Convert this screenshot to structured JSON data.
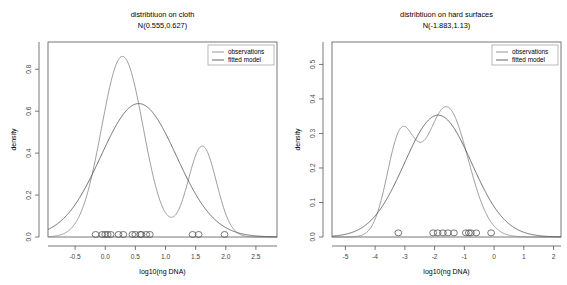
{
  "figure": {
    "width": 567,
    "height": 285,
    "background": "#ffffff",
    "line_color_observations": "#8a8a8a",
    "line_color_fitted": "#555555",
    "axis_color": "#555555"
  },
  "chart_data": [
    {
      "type": "line",
      "panel": "left",
      "title": "distribtiuon on cloth",
      "subtitle": "N(0.555,0.627)",
      "xlabel": "log10(ng DNA)",
      "ylabel": "density",
      "xlim": [
        -0.95,
        2.85
      ],
      "ylim": [
        0.0,
        0.93
      ],
      "xticks": [
        -0.5,
        0.0,
        0.5,
        1.0,
        1.5,
        2.0,
        2.5
      ],
      "xticklabels": [
        "-0.5",
        "0.0",
        "0.5",
        "1.0",
        "1.5",
        "2.0",
        "2.5"
      ],
      "yticks": [
        0.0,
        0.2,
        0.4,
        0.6,
        0.8
      ],
      "yticklabels": [
        "0.0",
        "0.2",
        "0.4",
        "0.6",
        "0.8"
      ],
      "grid": false,
      "legend_position": "top-right",
      "series": [
        {
          "name": "observations",
          "kind": "kernel-density-bimodal",
          "color": "#8a8a8a",
          "components": [
            {
              "weight": 0.745,
              "mean": 0.285,
              "sd": 0.345
            },
            {
              "weight": 0.255,
              "mean": 1.61,
              "sd": 0.235
            }
          ],
          "peaks": [
            {
              "x": 0.285,
              "y": 0.855
            },
            {
              "x": 1.61,
              "y": 0.265
            }
          ],
          "trough": {
            "x": 1.1,
            "y": 0.07
          }
        },
        {
          "name": "fitted model",
          "kind": "normal",
          "color": "#555555",
          "mean": 0.555,
          "sd": 0.627,
          "peak": {
            "x": 0.555,
            "y": 0.636
          }
        }
      ],
      "rug": {
        "name": "observations-rug",
        "marker": "open-circle",
        "y": 0.012,
        "values": [
          -0.16,
          -0.05,
          0.0,
          0.04,
          0.09,
          0.22,
          0.3,
          0.45,
          0.5,
          0.58,
          0.6,
          0.68,
          0.74,
          1.45,
          1.55,
          1.98
        ]
      }
    },
    {
      "type": "line",
      "panel": "right",
      "title": "distribtiuon on hard surfaces",
      "subtitle": "N(-1.883,1.13)",
      "xlabel": "log10(ng DNA)",
      "ylabel": "density",
      "xlim": [
        -5.45,
        2.25
      ],
      "ylim": [
        0.0,
        0.565
      ],
      "xticks": [
        -5,
        -4,
        -3,
        -2,
        -1,
        0,
        1,
        2
      ],
      "xticklabels": [
        "-5",
        "-4",
        "-3",
        "-2",
        "-1",
        "0",
        "1",
        "2"
      ],
      "yticks": [
        0.0,
        0.1,
        0.2,
        0.3,
        0.4,
        0.5
      ],
      "yticklabels": [
        "0.0",
        "0.1",
        "0.2",
        "0.3",
        "0.4",
        "0.5"
      ],
      "grid": false,
      "legend_position": "top-right",
      "series": [
        {
          "name": "observations",
          "kind": "kernel-density-bimodal",
          "color": "#8a8a8a",
          "components": [
            {
              "weight": 0.32,
              "mean": -3.15,
              "sd": 0.46
            },
            {
              "weight": 0.68,
              "mean": -1.6,
              "sd": 0.72
            }
          ],
          "peaks": [
            {
              "x": -3.15,
              "y": 0.231
            },
            {
              "x": -1.6,
              "y": 0.355
            }
          ],
          "trough": {
            "x": -2.62,
            "y": 0.201
          }
        },
        {
          "name": "fitted model",
          "kind": "normal",
          "color": "#555555",
          "mean": -1.883,
          "sd": 1.13,
          "peak": {
            "x": -1.883,
            "y": 0.289
          }
        }
      ],
      "rug": {
        "name": "observations-rug",
        "marker": "open-circle",
        "y": 0.012,
        "values": [
          -3.22,
          -2.05,
          -1.9,
          -1.72,
          -1.55,
          -1.35,
          -0.95,
          -0.85,
          -0.78,
          -0.6,
          -0.1
        ]
      }
    }
  ],
  "legend": {
    "items": [
      {
        "label": "observations",
        "color": "#8a8a8a"
      },
      {
        "label": "fitted model",
        "color": "#555555"
      }
    ]
  }
}
